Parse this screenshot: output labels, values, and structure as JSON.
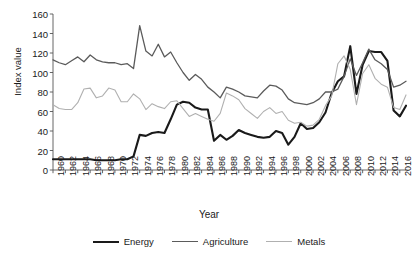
{
  "chart_data": {
    "type": "line",
    "title": "",
    "xlabel": "Year",
    "ylabel": "Index value",
    "ylim": [
      0,
      160
    ],
    "ytick_step": 20,
    "yticks": [
      160,
      140,
      120,
      100,
      80,
      60,
      40,
      20,
      0
    ],
    "xlim": [
      1960,
      2017
    ],
    "xtick_step": 2,
    "xticks": [
      1960,
      1962,
      1964,
      1966,
      1968,
      1970,
      1972,
      1974,
      1976,
      1978,
      1980,
      1982,
      1984,
      1986,
      1988,
      1990,
      1992,
      1994,
      1996,
      1998,
      2000,
      2002,
      2004,
      2006,
      2008,
      2010,
      2012,
      2014,
      2016
    ],
    "grid": false,
    "legend_position": "bottom",
    "x": [
      1960,
      1961,
      1962,
      1963,
      1964,
      1965,
      1966,
      1967,
      1968,
      1969,
      1970,
      1971,
      1972,
      1973,
      1974,
      1975,
      1976,
      1977,
      1978,
      1979,
      1980,
      1981,
      1982,
      1983,
      1984,
      1985,
      1986,
      1987,
      1988,
      1989,
      1990,
      1991,
      1992,
      1993,
      1994,
      1995,
      1996,
      1997,
      1998,
      1999,
      2000,
      2001,
      2002,
      2003,
      2004,
      2005,
      2006,
      2007,
      2008,
      2009,
      2010,
      2011,
      2012,
      2013,
      2014,
      2015,
      2016,
      2017
    ],
    "series": [
      {
        "name": "Energy",
        "color": "#1a1a1a",
        "width": 2.1,
        "values": [
          11,
          11,
          11,
          11,
          11,
          11,
          11,
          10,
          10,
          10,
          10,
          11,
          11,
          14,
          36,
          35,
          38,
          39,
          38,
          52,
          67,
          70,
          69,
          64,
          62,
          62,
          30,
          36,
          31,
          35,
          41,
          38,
          36,
          34,
          33,
          34,
          40,
          38,
          26,
          34,
          48,
          42,
          43,
          49,
          59,
          79,
          91,
          96,
          127,
          78,
          108,
          122,
          121,
          121,
          112,
          61,
          55,
          66
        ]
      },
      {
        "name": "Agriculture",
        "color": "#5b5b5b",
        "width": 1.3,
        "values": [
          113,
          110,
          108,
          112,
          116,
          111,
          118,
          113,
          111,
          110,
          110,
          108,
          109,
          104,
          148,
          122,
          117,
          129,
          116,
          121,
          110,
          100,
          92,
          98,
          93,
          85,
          80,
          74,
          85,
          83,
          80,
          76,
          75,
          74,
          81,
          87,
          86,
          82,
          73,
          69,
          68,
          67,
          69,
          73,
          80,
          80,
          83,
          96,
          114,
          97,
          110,
          124,
          113,
          109,
          103,
          85,
          87,
          91
        ]
      },
      {
        "name": "Metals",
        "color": "#b0b0b0",
        "width": 1.1,
        "values": [
          67,
          63,
          62,
          62,
          69,
          83,
          84,
          74,
          76,
          84,
          82,
          70,
          70,
          78,
          73,
          62,
          68,
          65,
          63,
          70,
          71,
          63,
          55,
          58,
          55,
          52,
          50,
          58,
          79,
          76,
          72,
          63,
          58,
          53,
          60,
          64,
          58,
          60,
          51,
          48,
          49,
          45,
          46,
          52,
          66,
          76,
          109,
          117,
          103,
          67,
          99,
          108,
          94,
          88,
          85,
          64,
          62,
          77
        ]
      }
    ]
  },
  "legend": {
    "items": [
      {
        "label": "Energy"
      },
      {
        "label": "Agriculture"
      },
      {
        "label": "Metals"
      }
    ]
  },
  "axis": {
    "x_title": "Year",
    "y_title": "Index value"
  }
}
